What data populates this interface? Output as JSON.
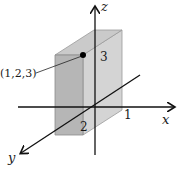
{
  "diagram": {
    "type": "3d-coordinate-box",
    "axes": {
      "x": {
        "label": "x",
        "tick_label": "1"
      },
      "y": {
        "label": "y",
        "tick_label": "2"
      },
      "z": {
        "label": "z",
        "tick_label": "3"
      }
    },
    "point": {
      "label": "(1,2,3)",
      "coords": [
        1,
        2,
        3
      ]
    },
    "box": {
      "dimensions": [
        1,
        2,
        3
      ]
    },
    "colors": {
      "front_face": "#b4b4b4",
      "side_face": "#d4d4d4",
      "top_face": "#c8c8c8",
      "axis": "#111111"
    }
  }
}
